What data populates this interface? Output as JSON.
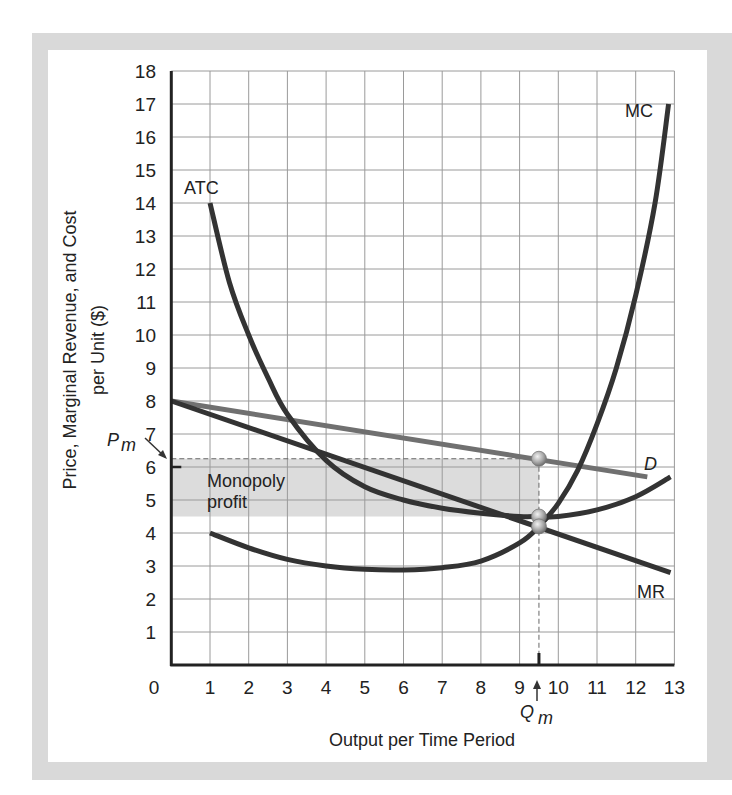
{
  "chart_data": {
    "type": "line",
    "title": "",
    "xlabel": "Output per Time Period",
    "ylabel_line1": "Price, Marginal Revenue, and Cost",
    "ylabel_line2": "per Unit ($)",
    "xlim": [
      0,
      13
    ],
    "ylim": [
      0,
      18
    ],
    "grid": true,
    "x_ticks": [
      "0",
      "1",
      "2",
      "3",
      "4",
      "5",
      "6",
      "7",
      "8",
      "9",
      "10",
      "11",
      "12",
      "13"
    ],
    "y_ticks": [
      "1",
      "2",
      "3",
      "4",
      "5",
      "6",
      "7",
      "8",
      "9",
      "10",
      "11",
      "12",
      "13",
      "14",
      "15",
      "16",
      "17",
      "18"
    ],
    "series": [
      {
        "name": "D",
        "color": "#707070",
        "points": [
          [
            0,
            8
          ],
          [
            12.3,
            5.7
          ]
        ]
      },
      {
        "name": "MR",
        "color": "#333333",
        "points": [
          [
            0,
            8
          ],
          [
            12.9,
            2.8
          ]
        ]
      },
      {
        "name": "ATC",
        "color": "#333333",
        "points": [
          [
            1,
            14
          ],
          [
            1.5,
            11.6
          ],
          [
            2,
            10
          ],
          [
            2.5,
            8.7
          ],
          [
            3,
            7.6
          ],
          [
            4,
            6.2
          ],
          [
            5,
            5.4
          ],
          [
            6,
            5.0
          ],
          [
            7,
            4.75
          ],
          [
            8,
            4.6
          ],
          [
            9,
            4.5
          ],
          [
            9.5,
            4.5
          ],
          [
            10,
            4.5
          ],
          [
            11,
            4.7
          ],
          [
            12,
            5.1
          ],
          [
            12.9,
            5.7
          ]
        ]
      },
      {
        "name": "MC",
        "color": "#333333",
        "points": [
          [
            1,
            4.0
          ],
          [
            2,
            3.55
          ],
          [
            3,
            3.2
          ],
          [
            4,
            3.0
          ],
          [
            5,
            2.9
          ],
          [
            6,
            2.88
          ],
          [
            7,
            2.95
          ],
          [
            8,
            3.15
          ],
          [
            9,
            3.7
          ],
          [
            9.5,
            4.2
          ],
          [
            10,
            4.9
          ],
          [
            10.5,
            5.9
          ],
          [
            11,
            7.3
          ],
          [
            11.5,
            9.0
          ],
          [
            12,
            11.2
          ],
          [
            12.5,
            14.0
          ],
          [
            12.85,
            17.0
          ]
        ]
      }
    ],
    "annotations": {
      "Qm": 9.5,
      "Pm": 6.25,
      "ATC_at_Qm": 4.5,
      "MR_equals_MC_at_Qm": 4.2,
      "profit_region": {
        "x": [
          0,
          9.5
        ],
        "y": [
          4.5,
          6.25
        ],
        "label_line1": "Monopoly",
        "label_line2": "profit",
        "color": "#dcdcdc"
      },
      "pm_label": "P",
      "pm_sub": "m",
      "qm_label": "Q",
      "qm_sub": "m",
      "curve_labels": {
        "ATC": "ATC",
        "MC": "MC",
        "D": "D",
        "MR": "MR"
      }
    }
  }
}
